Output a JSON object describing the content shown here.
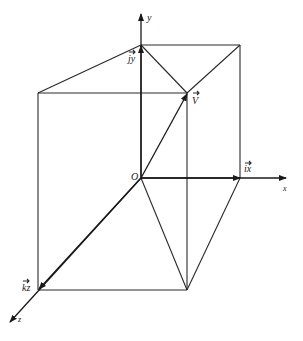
{
  "diagram": {
    "type": "3d-vector-decomposition",
    "labels": {
      "y_axis": "y",
      "x_axis": "x",
      "z_axis": "z",
      "origin": "O",
      "vector": "V",
      "j_component": "jy",
      "i_component": "ix",
      "k_component": "kz"
    },
    "colors": {
      "line": "#2a2a2a",
      "background": "#ffffff"
    }
  }
}
